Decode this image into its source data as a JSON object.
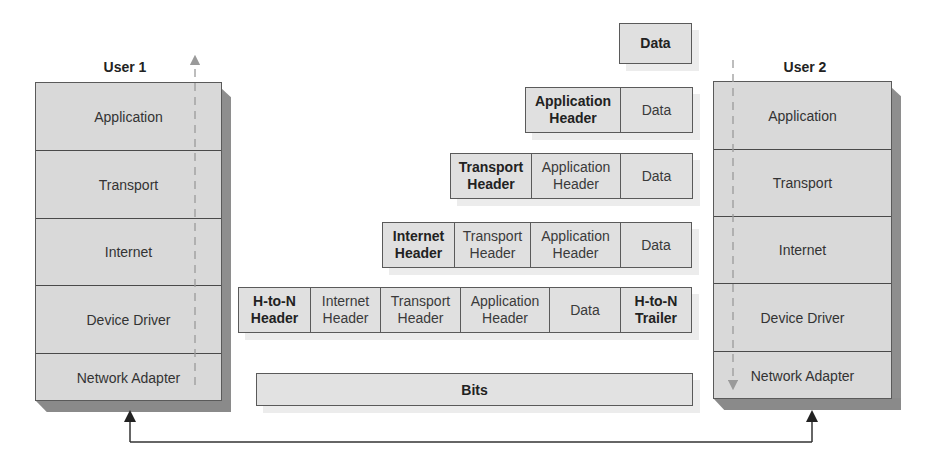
{
  "user1": {
    "label": "User 1",
    "layers": [
      "Application",
      "Transport",
      "Internet",
      "Device Driver",
      "Network Adapter"
    ],
    "flow_direction": "up"
  },
  "user2": {
    "label": "User 2",
    "layers": [
      "Application",
      "Transport",
      "Internet",
      "Device Driver",
      "Network Adapter"
    ],
    "flow_direction": "down"
  },
  "encapsulation": {
    "data_row": [
      {
        "text": "Data",
        "bold": true
      }
    ],
    "application_row": [
      {
        "text": "Application Header",
        "bold": true
      },
      {
        "text": "Data",
        "bold": false
      }
    ],
    "transport_row": [
      {
        "text": "Transport Header",
        "bold": true
      },
      {
        "text": "Application Header",
        "bold": false
      },
      {
        "text": "Data",
        "bold": false
      }
    ],
    "internet_row": [
      {
        "text": "Internet Header",
        "bold": true
      },
      {
        "text": "Transport Header",
        "bold": false
      },
      {
        "text": "Application Header",
        "bold": false
      },
      {
        "text": "Data",
        "bold": false
      }
    ],
    "hton_row": [
      {
        "text": "H-to-N Header",
        "bold": true
      },
      {
        "text": "Internet Header",
        "bold": false
      },
      {
        "text": "Transport Header",
        "bold": false
      },
      {
        "text": "Application Header",
        "bold": false
      },
      {
        "text": "Data",
        "bold": false
      },
      {
        "text": "H-to-N Trailer",
        "bold": true
      }
    ],
    "bits_label": "Bits"
  },
  "colors": {
    "layer_fill": "#d9d9d9",
    "pdu_fill": "#e0e0e0",
    "border": "#5a5a5a",
    "shadow": "#8e8e8e"
  }
}
